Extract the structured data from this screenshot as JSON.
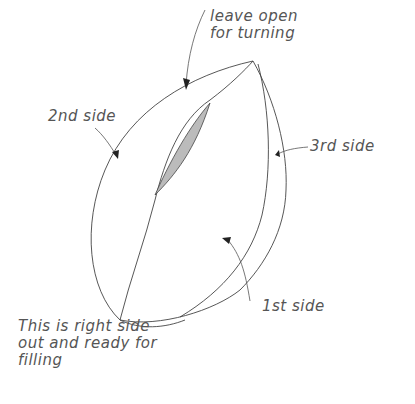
{
  "diagram": {
    "labels": {
      "leave_open": "leave open\nfor turning",
      "second_side": "2nd side",
      "third_side": "3rd side",
      "first_side": "1st side",
      "caption": "This is right side\nout and ready for\nfilling"
    },
    "colors": {
      "stroke": "#444444",
      "opening_fill": "#bbbbbb",
      "text": "#555555"
    }
  }
}
